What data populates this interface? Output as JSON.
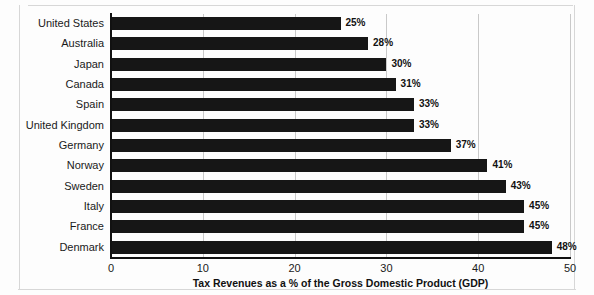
{
  "chart_data": {
    "type": "bar",
    "orientation": "horizontal",
    "title": "",
    "xlabel": "Tax Revenues as a % of the Gross Domestic Product (GDP)",
    "ylabel": "",
    "xlim": [
      0,
      50
    ],
    "xticks": [
      0,
      10,
      20,
      30,
      40,
      50
    ],
    "xtick_labels": [
      "0",
      "10",
      "20",
      "30",
      "40",
      "50"
    ],
    "grid": true,
    "grid_axis": "x",
    "legend": false,
    "bar_color": "#161616",
    "categories": [
      "United States",
      "Australia",
      "Japan",
      "Canada",
      "Spain",
      "United Kingdom",
      "Germany",
      "Norway",
      "Sweden",
      "Italy",
      "France",
      "Denmark"
    ],
    "values": [
      25,
      28,
      30,
      31,
      33,
      33,
      37,
      41,
      43,
      45,
      45,
      48
    ],
    "data_labels": [
      "25%",
      "28%",
      "30%",
      "31%",
      "33%",
      "33%",
      "37%",
      "41%",
      "43%",
      "45%",
      "45%",
      "48%"
    ]
  },
  "colors": {
    "bar": "#161616",
    "axis": "#111111",
    "grid": "#c9c9c9",
    "text": "#1a1a1a",
    "page_background": "#fdfdfd",
    "frame": "#d7d7d7"
  }
}
